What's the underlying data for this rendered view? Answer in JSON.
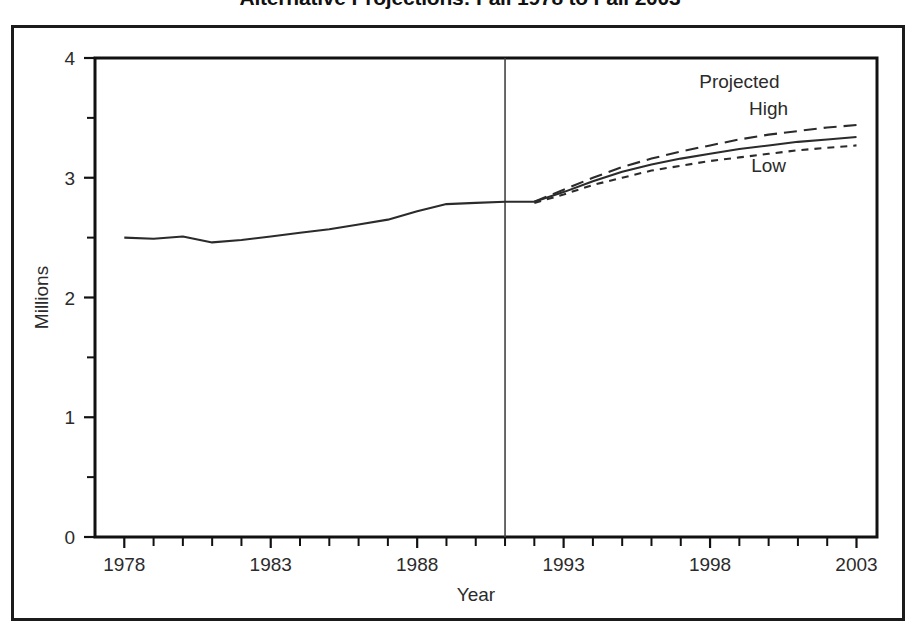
{
  "chart_data": {
    "type": "line",
    "title": "Alternative Projections: Fall 1978 to Fall 2003",
    "xlabel": "Year",
    "ylabel": "Millions",
    "xlim": [
      1977.0,
      2003.7
    ],
    "ylim": [
      0,
      4
    ],
    "grid": false,
    "legend_position": "inline-annotations",
    "x_tick_labels": [
      "1978",
      "1983",
      "1988",
      "1993",
      "1998",
      "2003"
    ],
    "x_tick_values": [
      1978,
      1983,
      1988,
      1993,
      1998,
      2003
    ],
    "x_minor_tick_step": 1,
    "y_tick_labels": [
      "0",
      "1",
      "2",
      "3",
      "4"
    ],
    "y_tick_values": [
      0,
      1,
      2,
      3,
      4
    ],
    "y_minor_tick_values": [
      0.5,
      1.5,
      2.5,
      3.5
    ],
    "divider_x": 1991,
    "divider_label": "actual / projected boundary",
    "annotations": [
      {
        "text": "Projected",
        "x": 1999.0,
        "y": 3.75
      },
      {
        "text": "High",
        "x": 2000.0,
        "y": 3.52
      },
      {
        "text": "Low",
        "x": 2000.0,
        "y": 3.05
      }
    ],
    "x": [
      1978,
      1979,
      1980,
      1981,
      1982,
      1983,
      1984,
      1985,
      1986,
      1987,
      1988,
      1989,
      1990,
      1991,
      1992,
      1993,
      1994,
      1995,
      1996,
      1997,
      1998,
      1999,
      2000,
      2001,
      2002,
      2003
    ],
    "series": [
      {
        "name": "Actual",
        "style": "solid",
        "values": [
          2.5,
          2.49,
          2.51,
          2.46,
          2.48,
          2.51,
          2.54,
          2.57,
          2.61,
          2.65,
          2.72,
          2.78,
          2.79,
          2.8,
          2.8,
          null,
          null,
          null,
          null,
          null,
          null,
          null,
          null,
          null,
          null,
          null
        ]
      },
      {
        "name": "Middle",
        "style": "solid",
        "values": [
          null,
          null,
          null,
          null,
          null,
          null,
          null,
          null,
          null,
          null,
          null,
          null,
          null,
          null,
          2.8,
          2.88,
          2.97,
          3.05,
          3.11,
          3.16,
          3.2,
          3.24,
          3.27,
          3.3,
          3.32,
          3.34
        ],
        "endpoint": 3.34
      },
      {
        "name": "High",
        "style": "long-dash",
        "values": [
          null,
          null,
          null,
          null,
          null,
          null,
          null,
          null,
          null,
          null,
          null,
          null,
          null,
          null,
          2.8,
          2.9,
          3.0,
          3.09,
          3.16,
          3.22,
          3.27,
          3.32,
          3.36,
          3.39,
          3.42,
          3.44
        ],
        "endpoint": 3.44
      },
      {
        "name": "Low",
        "style": "short-dash",
        "values": [
          null,
          null,
          null,
          null,
          null,
          null,
          null,
          null,
          null,
          null,
          null,
          null,
          null,
          null,
          2.79,
          2.86,
          2.94,
          3.0,
          3.06,
          3.1,
          3.14,
          3.17,
          3.2,
          3.23,
          3.25,
          3.27
        ],
        "endpoint": 3.27
      }
    ],
    "colors": {
      "line": "#2b2b2b",
      "axis": "#111111",
      "background": "#ffffff",
      "text": "#2b2b2b",
      "divider": "#444444"
    }
  }
}
